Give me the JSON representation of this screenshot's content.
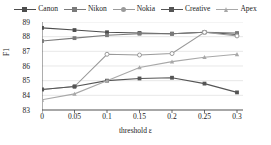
{
  "chart_data": {
    "type": "line",
    "title": "",
    "xlabel": "threshold ε",
    "ylabel": "F1",
    "x": [
      0,
      0.05,
      0.1,
      0.15,
      0.2,
      0.25,
      0.3
    ],
    "xtick_labels": [
      "0",
      "0.05",
      "0.1",
      "0.15",
      "0.2",
      "0.25",
      "0.3"
    ],
    "ytick_labels": [
      "89",
      "88",
      "87",
      "86",
      "85",
      "84",
      "83"
    ],
    "ylim": [
      83,
      89
    ],
    "xlim": [
      0,
      0.3
    ],
    "grid": true,
    "legend_position": "top",
    "series": [
      {
        "name": "Canon",
        "color": "#4d4d4d",
        "marker": "square",
        "values": [
          88.6,
          88.45,
          88.3,
          88.25,
          88.2,
          88.3,
          88.15
        ]
      },
      {
        "name": "Nikon",
        "color": "#7a7a7a",
        "marker": "square",
        "values": [
          87.7,
          87.9,
          88.1,
          88.2,
          88.2,
          88.3,
          88.25
        ]
      },
      {
        "name": "Nokia",
        "color": "#9a9a9a",
        "marker": "circle",
        "values": [
          84.4,
          84.6,
          86.8,
          86.75,
          86.85,
          88.3,
          88.05
        ]
      },
      {
        "name": "Creative",
        "color": "#555555",
        "marker": "square",
        "values": [
          84.4,
          84.6,
          85.0,
          85.15,
          85.2,
          84.8,
          84.2
        ]
      },
      {
        "name": "Apex",
        "color": "#a8a8a8",
        "marker": "triangle",
        "values": [
          83.7,
          84.1,
          85.0,
          85.9,
          86.3,
          86.6,
          86.8
        ]
      }
    ]
  },
  "legend": {
    "items": [
      {
        "label": "Canon"
      },
      {
        "label": "Nikon"
      },
      {
        "label": "Nokia"
      },
      {
        "label": "Creative"
      },
      {
        "label": "Apex"
      }
    ]
  }
}
